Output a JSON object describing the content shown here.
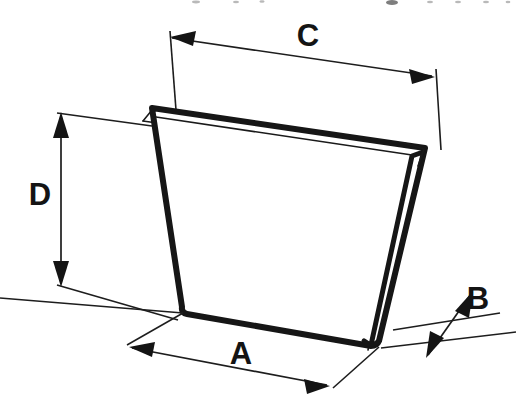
{
  "diagram": {
    "background_color": "#ffffff",
    "line_color": "#161616",
    "label_color": "#141414",
    "dimensions": [
      {
        "id": "A",
        "label": "A",
        "meaning": "bottom width",
        "placement": "below",
        "label_x": 241,
        "label_y": 356,
        "arrow_style": "double",
        "start_x": 132,
        "start_y": 348,
        "end_x": 327,
        "end_y": 385
      },
      {
        "id": "B",
        "label": "B",
        "meaning": "thickness",
        "placement": "right",
        "label_x": 478,
        "label_y": 301,
        "arrow_style": "double",
        "start_x": 467,
        "start_y": 313,
        "end_x": 432,
        "end_y": 351
      },
      {
        "id": "C",
        "label": "C",
        "meaning": "top width",
        "placement": "above",
        "label_x": 308,
        "label_y": 38,
        "arrow_style": "double",
        "start_x": 172,
        "start_y": 38,
        "end_x": 432,
        "end_y": 76
      },
      {
        "id": "D",
        "label": "D",
        "meaning": "height",
        "placement": "left",
        "label_x": 40,
        "label_y": 197,
        "arrow_style": "double",
        "start_x": 61,
        "start_y": 115,
        "end_x": 61,
        "end_y": 283
      }
    ],
    "shape": {
      "name": "tapered-block",
      "front_face_points": "152,108 425,148 378,343 183,310",
      "top_back_points": "139,119 409,158",
      "right_back_points": "409,158 366,352",
      "vertices": [
        {
          "name": "top-left",
          "x": 152,
          "y": 108
        },
        {
          "name": "top-right",
          "x": 425,
          "y": 148
        },
        {
          "name": "bottom-right",
          "x": 378,
          "y": 343
        },
        {
          "name": "bottom-left",
          "x": 183,
          "y": 310
        }
      ]
    }
  }
}
